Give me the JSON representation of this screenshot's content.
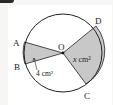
{
  "diagram": {
    "points": {
      "A": "A",
      "B": "B",
      "C": "C",
      "D": "D",
      "O": "O"
    },
    "labels": {
      "sector_aob_area": "4 cm²",
      "sector_doc_area_var": "x",
      "sector_doc_area_unit": " cm²"
    },
    "colors": {
      "shade": "#c8c8c8",
      "stroke": "#222222",
      "background": "#ffffff"
    }
  }
}
